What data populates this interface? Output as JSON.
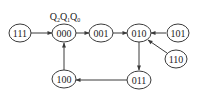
{
  "diagram": {
    "type": "state-transition",
    "header_label": {
      "base": "Q",
      "subs": [
        "2",
        "1",
        "0"
      ]
    },
    "nodes": [
      {
        "id": "111",
        "label": "111",
        "cx": 20,
        "cy": 33
      },
      {
        "id": "000",
        "label": "000",
        "cx": 64,
        "cy": 33
      },
      {
        "id": "001",
        "label": "001",
        "cx": 101,
        "cy": 33
      },
      {
        "id": "010",
        "label": "010",
        "cx": 139,
        "cy": 33
      },
      {
        "id": "101",
        "label": "101",
        "cx": 178,
        "cy": 33
      },
      {
        "id": "110",
        "label": "110",
        "cx": 176,
        "cy": 59
      },
      {
        "id": "011",
        "label": "011",
        "cx": 139,
        "cy": 80
      },
      {
        "id": "100",
        "label": "100",
        "cx": 64,
        "cy": 79
      }
    ],
    "edges": [
      {
        "from": "111",
        "to": "000"
      },
      {
        "from": "000",
        "to": "001"
      },
      {
        "from": "001",
        "to": "010"
      },
      {
        "from": "101",
        "to": "010"
      },
      {
        "from": "110",
        "to": "010"
      },
      {
        "from": "010",
        "to": "011"
      },
      {
        "from": "011",
        "to": "100"
      },
      {
        "from": "100",
        "to": "000"
      }
    ]
  }
}
